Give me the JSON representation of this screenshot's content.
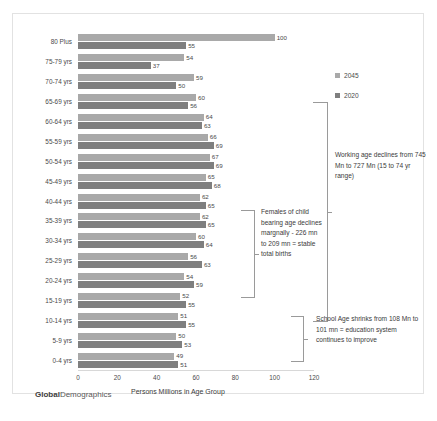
{
  "chart_data": {
    "type": "bar",
    "orientation": "horizontal",
    "title": "",
    "xlabel": "Persons Millions in Age Group",
    "ylabel": "",
    "xlim": [
      0,
      120
    ],
    "xticks": [
      0,
      20,
      40,
      60,
      80,
      100,
      120
    ],
    "grid": false,
    "legend_position": "top-right",
    "categories": [
      "80 Plus",
      "75-79 yrs",
      "70-74 yrs",
      "65-69 yrs",
      "60-64 yrs",
      "55-59 yrs",
      "50-54 yrs",
      "45-49 yrs",
      "40-44 yrs",
      "35-39 yrs",
      "30-34 yrs",
      "25-29 yrs",
      "20-24 yrs",
      "15-19 yrs",
      "10-14 yrs",
      "5-9 yrs",
      "0-4 yrs"
    ],
    "series": [
      {
        "name": "2045",
        "color": "#a9a9a9",
        "values": [
          100,
          54,
          59,
          60,
          64,
          66,
          67,
          65,
          62,
          62,
          60,
          56,
          54,
          52,
          51,
          50,
          49
        ]
      },
      {
        "name": "2020",
        "color": "#7f7f7f",
        "values": [
          55,
          37,
          50,
          56,
          63,
          69,
          69,
          68,
          65,
          65,
          64,
          63,
          59,
          55,
          55,
          53,
          51
        ]
      }
    ]
  },
  "legend": {
    "items": [
      {
        "label": "2045",
        "color": "#a9a9a9"
      },
      {
        "label": "2020",
        "color": "#7f7f7f"
      }
    ]
  },
  "annotations": {
    "working_age": "Working age declines from 745 Mn to 727 Mn  (15 to 74 yr range)",
    "females_child_bearing": "Females of child bearing age declines margnally -  226 mn to 209 mn = stable total births",
    "school_age": "School Age shrinks from 108 Mn to 101 mn = education system continues  to improve"
  },
  "watermark": {
    "bold": "Global",
    "light": "Demographics"
  }
}
